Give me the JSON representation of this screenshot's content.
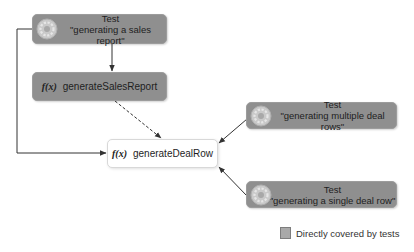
{
  "diagram": {
    "nodes": {
      "test_sales_report": {
        "type": "Test",
        "title": "Test",
        "label": "\"generating a sales report\"",
        "icon": "test-gear-icon",
        "covered": true
      },
      "fn_generate_sales_report": {
        "type": "Function",
        "prefix": "f(x)",
        "label": "generateSalesReport",
        "covered": true
      },
      "fn_generate_deal_row": {
        "type": "Function",
        "prefix": "f(x)",
        "label": "generateDealRow",
        "covered": false
      },
      "test_multiple_deal_rows": {
        "type": "Test",
        "title": "Test",
        "label": "\"generating multiple deal rows\"",
        "icon": "test-gear-icon",
        "covered": true
      },
      "test_single_deal_row": {
        "type": "Test",
        "title": "Test",
        "label": "\"generating a single deal row\"",
        "icon": "test-gear-icon",
        "covered": true
      }
    },
    "edges": [
      {
        "from": "test_sales_report",
        "to": "fn_generate_sales_report",
        "style": "solid"
      },
      {
        "from": "test_sales_report",
        "to": "fn_generate_deal_row",
        "style": "solid"
      },
      {
        "from": "fn_generate_sales_report",
        "to": "fn_generate_deal_row",
        "style": "dashed"
      },
      {
        "from": "test_multiple_deal_rows",
        "to": "fn_generate_deal_row",
        "style": "solid"
      },
      {
        "from": "test_single_deal_row",
        "to": "fn_generate_deal_row",
        "style": "solid"
      }
    ],
    "legend": {
      "label": "Directly covered by tests",
      "swatch_color": "#a9a9a9"
    },
    "colors": {
      "covered_fill": "#8f8f8f",
      "plain_fill": "#ffffff",
      "edge": "#333333"
    }
  }
}
